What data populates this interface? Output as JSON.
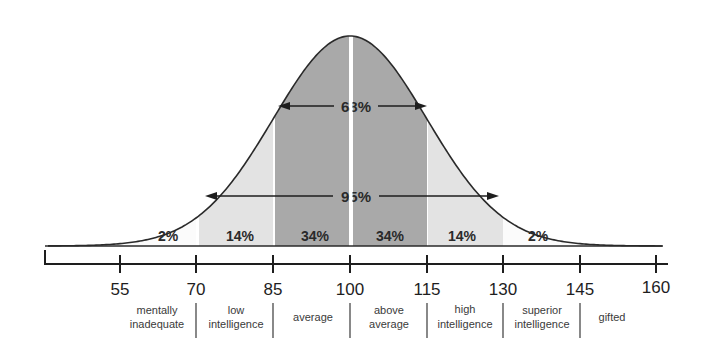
{
  "chart_data": {
    "type": "area",
    "title": "",
    "xlabel": "",
    "ylabel": "",
    "distribution": "normal",
    "mean": 100,
    "sd": 15,
    "x_ticks": [
      55,
      70,
      85,
      100,
      115,
      130,
      145,
      160
    ],
    "xlim": [
      48,
      160
    ],
    "segments": [
      {
        "from": 55,
        "to": 70,
        "percent": "2%",
        "shade": "#fbfbfb"
      },
      {
        "from": 70,
        "to": 85,
        "percent": "14%",
        "shade": "#e3e3e3"
      },
      {
        "from": 85,
        "to": 100,
        "percent": "34%",
        "shade": "#a9a9a9"
      },
      {
        "from": 100,
        "to": 115,
        "percent": "34%",
        "shade": "#a9a9a9"
      },
      {
        "from": 115,
        "to": 130,
        "percent": "14%",
        "shade": "#e3e3e3"
      },
      {
        "from": 130,
        "to": 145,
        "percent": "2%",
        "shade": "#fbfbfb"
      }
    ],
    "ranges": [
      {
        "label": "68%",
        "from": 85,
        "to": 115
      },
      {
        "label": "95%",
        "from": 70,
        "to": 130
      }
    ],
    "categories": [
      {
        "from": 55,
        "to": 70,
        "label_lines": [
          "mentally",
          "inadequate"
        ]
      },
      {
        "from": 70,
        "to": 85,
        "label_lines": [
          "low",
          "intelligence"
        ]
      },
      {
        "from": 85,
        "to": 100,
        "label_lines": [
          "average"
        ]
      },
      {
        "from": 100,
        "to": 115,
        "label_lines": [
          "above",
          "average"
        ]
      },
      {
        "from": 115,
        "to": 130,
        "label_lines": [
          "high",
          "intelligence"
        ]
      },
      {
        "from": 130,
        "to": 145,
        "label_lines": [
          "superior",
          "intelligence"
        ]
      },
      {
        "from": 145,
        "to": 160,
        "label_lines": [
          "gifted"
        ]
      }
    ]
  },
  "labels": {
    "pct_2_left": "2%",
    "pct_14_left": "14%",
    "pct_34_left": "34%",
    "pct_34_right": "34%",
    "pct_14_right": "14%",
    "pct_2_right": "2%",
    "range_68": "68%",
    "range_95": "95%",
    "tick_55": "55",
    "tick_70": "70",
    "tick_85": "85",
    "tick_100": "100",
    "tick_115": "115",
    "tick_130": "130",
    "tick_145": "145",
    "tick_160": "160",
    "cat_mentally": "mentally",
    "cat_inadequate": "inadequate",
    "cat_low": "low",
    "cat_low_intel": "intelligence",
    "cat_average": "average",
    "cat_above": "above",
    "cat_above_avg": "average",
    "cat_high": "high",
    "cat_high_intel": "intelligence",
    "cat_superior": "superior",
    "cat_superior_intel": "intelligence",
    "cat_gifted": "gifted"
  },
  "colors": {
    "outer": "#fbfbfb",
    "middle": "#e3e3e3",
    "inner": "#a9a9a9",
    "line": "#2a2a2a"
  }
}
